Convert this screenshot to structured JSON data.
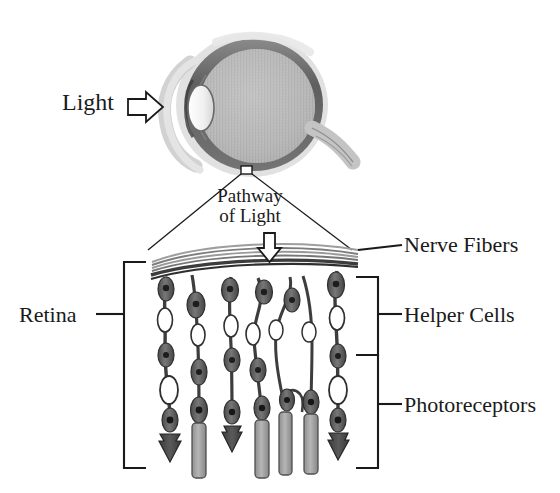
{
  "figure": {
    "background_color": "#ffffff",
    "ink_color": "#1a1a1a"
  },
  "labels": {
    "light": "Light",
    "pathway_line1": "Pathway",
    "pathway_line2": "of Light",
    "nerve_fibers": "Nerve Fibers",
    "helper_cells": "Helper Cells",
    "photoreceptors": "Photoreceptors",
    "retina": "Retina"
  },
  "icons": {
    "light_arrow": "arrow-right-outline-icon",
    "pathway_arrow": "arrow-down-outline-icon",
    "callout_box": "callout-square-icon"
  },
  "eye": {
    "parts": [
      "sclera-outer-ring",
      "choroid-ring",
      "vitreous-body",
      "lens",
      "cornea",
      "optic-nerve"
    ],
    "colors": {
      "sclera": "#d8d8d8",
      "choroid": "#6b6b6b",
      "vitreous": "#b9b9b9",
      "lens": "#f4f4f4",
      "optic_nerve": "#c9c9c9"
    }
  },
  "retina": {
    "layers": [
      "nerve-fiber-layer",
      "helper-cell-layer",
      "photoreceptor-layer"
    ],
    "nerve_fiber_strands": 5,
    "neuron_columns": 7,
    "photoreceptor_types": [
      "cone",
      "rod"
    ],
    "colors": {
      "cell_dark": "#4a4a4a",
      "cell_mid": "#6e6e6e",
      "cell_light": "#a8a8a8",
      "nerve_band": "#8c8c8c"
    }
  },
  "brackets": {
    "retina": {
      "label": "Retina",
      "side": "left",
      "top": 262,
      "bottom": 468
    },
    "helper_cells": {
      "label": "Helper Cells",
      "side": "right",
      "top": 277,
      "bottom": 355
    },
    "photoreceptors": {
      "label": "Photoreceptors",
      "side": "right",
      "top": 355,
      "bottom": 468
    }
  }
}
